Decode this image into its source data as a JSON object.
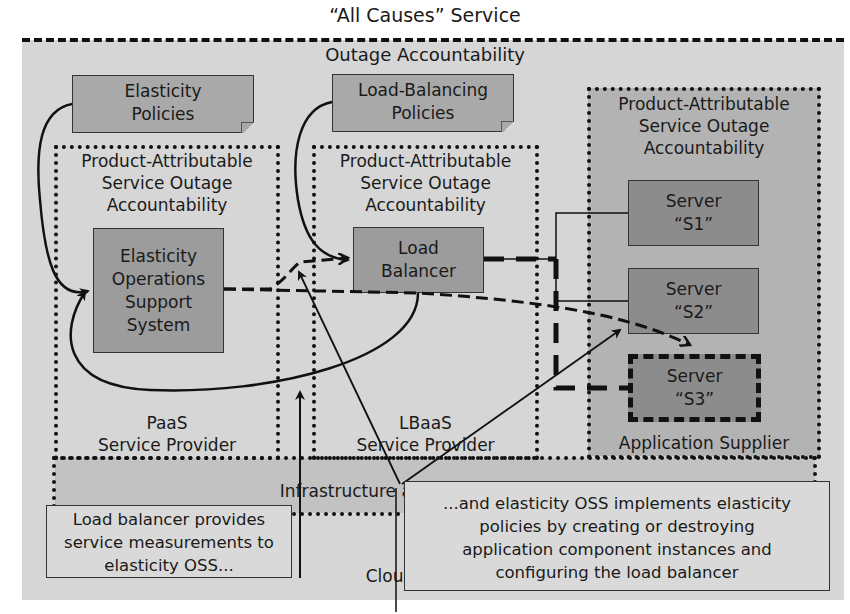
{
  "title": "“All Causes” Service",
  "outer_label": "Outage Accountability",
  "policies": {
    "elasticity": [
      "Elasticity",
      "Policies"
    ],
    "load_balancing": [
      "Load-Balancing",
      "Policies"
    ]
  },
  "zones": {
    "paas": {
      "header": [
        "Product-Attributable",
        "Service Outage",
        "Accountability"
      ],
      "footer": [
        "PaaS",
        "Service Provider"
      ]
    },
    "lbaas": {
      "header": [
        "Product-Attributable",
        "Service Outage",
        "Accountability"
      ],
      "footer": [
        "LBaaS",
        "Service Provider"
      ]
    },
    "app": {
      "header": [
        "Product-Attributable",
        "Service Outage",
        "Accountability"
      ],
      "footer": "Application Supplier"
    },
    "infra": {
      "label": "Infrastructure as a Service Supplier"
    },
    "cloud": {
      "label": "Cloud"
    }
  },
  "components": {
    "eoss": [
      "Elasticity",
      "Operations",
      "Support",
      "System"
    ],
    "load_balancer": [
      "Load",
      "Balancer"
    ],
    "servers": [
      {
        "line1": "Server",
        "line2": "“S1”",
        "state": "active"
      },
      {
        "line1": "Server",
        "line2": "“S2”",
        "state": "active"
      },
      {
        "line1": "Server",
        "line2": "“S3”",
        "state": "being-created"
      }
    ]
  },
  "captions": {
    "left": [
      "Load balancer provides",
      "service measurements to",
      "elasticity OSS..."
    ],
    "right": [
      "...and elasticity OSS implements elasticity",
      "policies by creating or destroying",
      "application component instances and",
      "configuring the load balancer"
    ]
  },
  "colors": {
    "outer_bg": "#d6d6d6",
    "note_fill": "#a9a9a9",
    "box_fill": "#9c9c9c",
    "server_fill": "#8c8c8c",
    "app_zone_fill": "#b3b3b3",
    "caption_fill": "#d9d9d9",
    "line": "#111111"
  }
}
